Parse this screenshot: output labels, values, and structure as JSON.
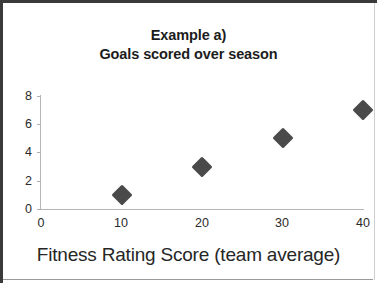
{
  "chart_data": {
    "type": "scatter",
    "title": "Example a)\nGoals scored over season",
    "title_lines": [
      "Example a)",
      "Goals scored over season"
    ],
    "xlabel": "Fitness Rating Score (team average)",
    "ylabel": "",
    "x": [
      10,
      20,
      30,
      40
    ],
    "values": [
      1,
      3,
      5,
      7
    ],
    "points": [
      {
        "x": 10,
        "y": 1
      },
      {
        "x": 20,
        "y": 3
      },
      {
        "x": 30,
        "y": 5
      },
      {
        "x": 40,
        "y": 7
      }
    ],
    "xlim": [
      0,
      40
    ],
    "ylim": [
      0,
      8
    ],
    "xticks": [
      "0",
      "10",
      "20",
      "30",
      "40"
    ],
    "yticks": [
      "0",
      "2",
      "4",
      "6",
      "8"
    ],
    "grid": false,
    "legend": null,
    "marker": "diamond",
    "marker_color": "#4a4a4a",
    "axis_color": "#b6b6b6"
  }
}
